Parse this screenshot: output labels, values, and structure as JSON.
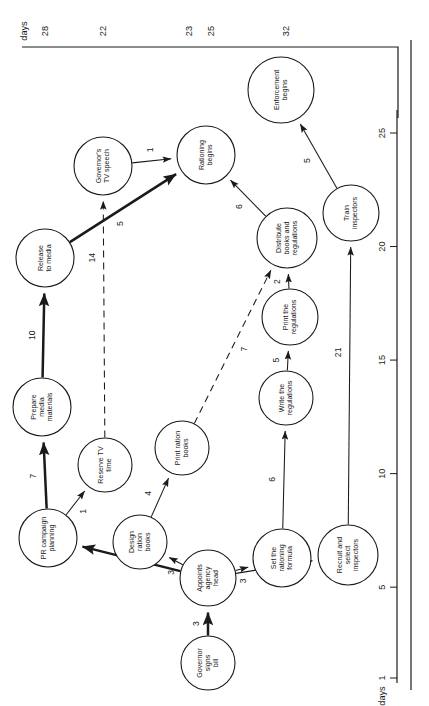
{
  "figure": {
    "type": "pert-network-diagram",
    "orientation": "rotated-90-ccw",
    "background": "#ffffff",
    "ink": "#1a1a1a"
  },
  "top_axis": {
    "caption": "days",
    "values": [
      "28",
      "22",
      "23",
      "25",
      "32"
    ]
  },
  "bottom_axis": {
    "caption": "days",
    "ticks": [
      "1",
      "5",
      "10",
      "15",
      "20",
      "25"
    ]
  },
  "nodes": [
    {
      "id": "governor_signs_bill",
      "label": "Governor\nsigns\nbill"
    },
    {
      "id": "appoints_agency_head",
      "label": "Appoints\nagency\nhead"
    },
    {
      "id": "pr_campaign_planning",
      "label": "PR campaign\nplanning"
    },
    {
      "id": "prepare_media",
      "label": "Prepare\nmedia\nmaterials"
    },
    {
      "id": "release_to_media",
      "label": "Release\nto media"
    },
    {
      "id": "reserve_tv_time",
      "label": "Reserve TV\ntime"
    },
    {
      "id": "governors_tv_speech",
      "label": "Governor's\nTV speech"
    },
    {
      "id": "design_ration_books",
      "label": "Design\nration\nbooks"
    },
    {
      "id": "print_ration_books",
      "label": "Print ration\nbooks"
    },
    {
      "id": "set_rationing_formula",
      "label": "Set the\nrationing\nformula"
    },
    {
      "id": "write_regulations",
      "label": "Write the\nregulations"
    },
    {
      "id": "print_regulations",
      "label": "Print the\nregulations"
    },
    {
      "id": "distribute_books",
      "label": "Distribute\nbooks and\nregulations"
    },
    {
      "id": "rationing_begins",
      "label": "Rationing\nbegins"
    },
    {
      "id": "recruit_inspectors",
      "label": "Recruit and\nselect\ninspectors"
    },
    {
      "id": "train_inspectors",
      "label": "Train\ninspectors"
    },
    {
      "id": "enforcement_begins",
      "label": "Enforcement\nbegins"
    }
  ],
  "edges": [
    {
      "from": "governor_signs_bill",
      "to": "appoints_agency_head",
      "weight": "3",
      "style": "thick"
    },
    {
      "from": "appoints_agency_head",
      "to": "pr_campaign_planning",
      "weight": "3",
      "style": "thick"
    },
    {
      "from": "appoints_agency_head",
      "to": "design_ration_books",
      "weight": "3",
      "style": "thin"
    },
    {
      "from": "appoints_agency_head",
      "to": "set_rationing_formula",
      "weight": "3",
      "style": "thin"
    },
    {
      "from": "appoints_agency_head",
      "to": "recruit_inspectors",
      "weight": "3",
      "style": "thin"
    },
    {
      "from": "pr_campaign_planning",
      "to": "prepare_media",
      "weight": "7",
      "style": "thick"
    },
    {
      "from": "pr_campaign_planning",
      "to": "reserve_tv_time",
      "weight": "1",
      "style": "thin"
    },
    {
      "from": "prepare_media",
      "to": "release_to_media",
      "weight": "10",
      "style": "thick"
    },
    {
      "from": "reserve_tv_time",
      "to": "governors_tv_speech",
      "weight": "14",
      "style": "dashed"
    },
    {
      "from": "release_to_media",
      "to": "rationing_begins",
      "weight": "5",
      "style": "thick"
    },
    {
      "from": "governors_tv_speech",
      "to": "rationing_begins",
      "weight": "1",
      "style": "thin"
    },
    {
      "from": "design_ration_books",
      "to": "print_ration_books",
      "weight": "4",
      "style": "thin"
    },
    {
      "from": "print_ration_books",
      "to": "distribute_books",
      "weight": "7",
      "style": "dashed"
    },
    {
      "from": "set_rationing_formula",
      "to": "write_regulations",
      "weight": "6",
      "style": "thin"
    },
    {
      "from": "write_regulations",
      "to": "print_regulations",
      "weight": "5",
      "style": "thin"
    },
    {
      "from": "print_regulations",
      "to": "distribute_books",
      "weight": "2",
      "style": "thin"
    },
    {
      "from": "distribute_books",
      "to": "rationing_begins",
      "weight": "6",
      "style": "thin"
    },
    {
      "from": "recruit_inspectors",
      "to": "train_inspectors",
      "weight": "21",
      "style": "thin"
    },
    {
      "from": "train_inspectors",
      "to": "enforcement_begins",
      "weight": "5",
      "style": "thin"
    }
  ]
}
